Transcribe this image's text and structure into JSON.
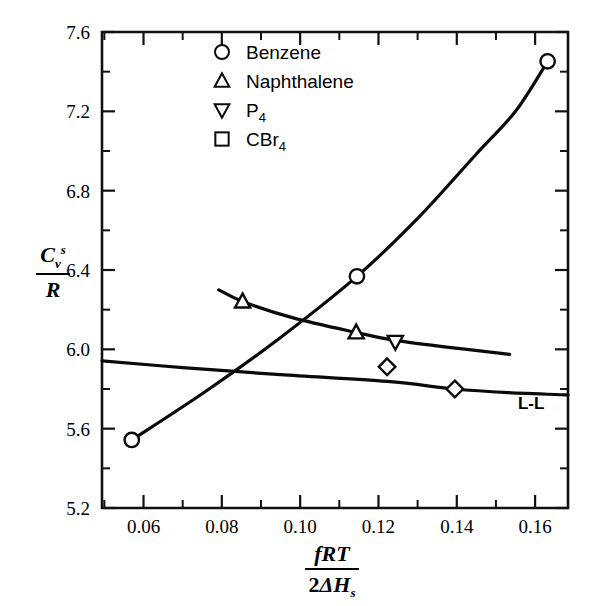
{
  "chart_data": {
    "type": "scatter",
    "title": "",
    "xlabel": "fRT / 2ΔH_s",
    "ylabel": "C_v^s / R",
    "xlim": [
      0.0494,
      0.1684
    ],
    "ylim": [
      5.2,
      7.6
    ],
    "grid": false,
    "x_ticks_major": [
      0.06,
      0.08,
      0.1,
      0.12,
      0.14,
      0.16
    ],
    "x_ticklabels": [
      "0.06",
      "0.08",
      "0.10",
      "0.12",
      "0.14",
      "0.16"
    ],
    "x_ticks_minor": [
      0.05,
      0.07,
      0.09,
      0.11,
      0.13,
      0.15
    ],
    "y_ticks_major": [
      5.2,
      5.6,
      6.0,
      6.4,
      6.8,
      7.2,
      7.6
    ],
    "y_ticklabels": [
      "5.2",
      "5.6",
      "6.0",
      "6.4",
      "6.8",
      "7.2",
      "7.6"
    ],
    "y_ticks_minor": [
      5.4,
      5.8,
      6.2,
      6.6,
      7.0,
      7.4
    ],
    "legend_position": "top-center",
    "series": [
      {
        "name": "Benzene",
        "marker": "circle",
        "legend_marker": "circle",
        "points": [
          {
            "x": 0.057,
            "y": 5.543
          },
          {
            "x": 0.1145,
            "y": 6.368
          },
          {
            "x": 0.1632,
            "y": 7.452
          }
        ],
        "curve": [
          {
            "x": 0.057,
            "y": 5.543
          },
          {
            "x": 0.076,
            "y": 5.79
          },
          {
            "x": 0.095,
            "y": 6.06
          },
          {
            "x": 0.1145,
            "y": 6.368
          },
          {
            "x": 0.13,
            "y": 6.66
          },
          {
            "x": 0.145,
            "y": 6.985
          },
          {
            "x": 0.155,
            "y": 7.2
          },
          {
            "x": 0.1632,
            "y": 7.452
          }
        ]
      },
      {
        "name": "Naphthalene",
        "marker": "triangle-up",
        "legend_marker": "triangle-up",
        "points": [
          {
            "x": 0.0853,
            "y": 6.241
          },
          {
            "x": 0.1143,
            "y": 6.085
          }
        ],
        "curve": [
          {
            "x": 0.0792,
            "y": 6.3
          },
          {
            "x": 0.0853,
            "y": 6.241
          },
          {
            "x": 0.098,
            "y": 6.16
          },
          {
            "x": 0.1143,
            "y": 6.085
          },
          {
            "x": 0.1243,
            "y": 6.045
          },
          {
            "x": 0.138,
            "y": 6.01
          },
          {
            "x": 0.1535,
            "y": 5.975
          }
        ]
      },
      {
        "name": "P4",
        "marker": "triangle-down",
        "legend_marker": "triangle-down",
        "points": [
          {
            "x": 0.1243,
            "y": 6.038
          }
        ],
        "curve": []
      },
      {
        "name": "CBr4",
        "marker": "diamond",
        "legend_marker": "square",
        "points": [
          {
            "x": 0.1222,
            "y": 5.912
          },
          {
            "x": 0.1395,
            "y": 5.8
          }
        ],
        "curve": []
      },
      {
        "name": "L-L",
        "marker": "none",
        "legend_marker": "none",
        "points": [],
        "curve": [
          {
            "x": 0.0494,
            "y": 5.942
          },
          {
            "x": 0.07,
            "y": 5.908
          },
          {
            "x": 0.095,
            "y": 5.872
          },
          {
            "x": 0.1222,
            "y": 5.838
          },
          {
            "x": 0.1395,
            "y": 5.8
          },
          {
            "x": 0.153,
            "y": 5.782
          },
          {
            "x": 0.1684,
            "y": 5.77
          }
        ]
      }
    ],
    "annotations": [
      {
        "text": "L-L",
        "x": 0.159,
        "y": 5.7
      }
    ]
  },
  "legend": {
    "entries": [
      {
        "label": "Benzene",
        "sub": "",
        "marker": "circle"
      },
      {
        "label": "Naphthalene",
        "sub": "",
        "marker": "triangle-up"
      },
      {
        "label": "P",
        "sub": "4",
        "marker": "triangle-down"
      },
      {
        "label": "CBr",
        "sub": "4",
        "marker": "square"
      }
    ]
  },
  "axis_titles": {
    "y": {
      "numerator": "C",
      "numerator_sub": "v",
      "numerator_sup": "s",
      "denominator": "R"
    },
    "x": {
      "numerator": "fRT",
      "denominator_prefix": "2",
      "denominator_symbol": "ΔH",
      "denominator_sub": "s"
    }
  },
  "colors": {
    "ink": "#0a0a0a",
    "background": "#ffffff"
  }
}
